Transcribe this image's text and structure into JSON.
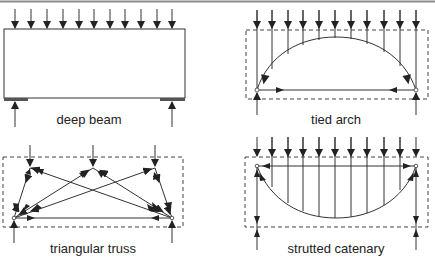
{
  "diagram": {
    "header_rule_color": "#8a8a8a",
    "line_color": "#333333",
    "panels": [
      {
        "id": "deep-beam",
        "label": "deep beam"
      },
      {
        "id": "tied-arch",
        "label": "tied arch"
      },
      {
        "id": "triangular-truss",
        "label": "triangular truss"
      },
      {
        "id": "strutted-catenary",
        "label": "strutted catenary"
      }
    ]
  }
}
